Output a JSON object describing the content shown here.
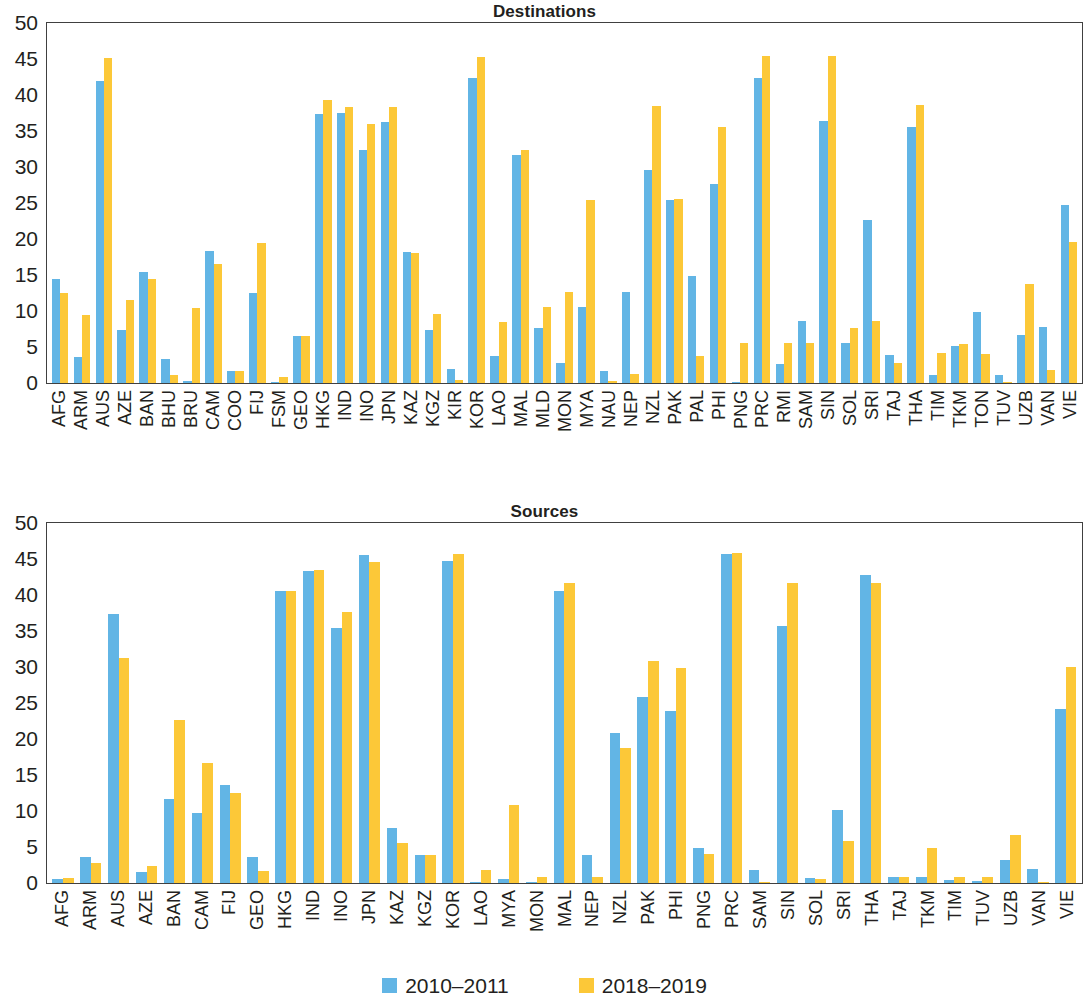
{
  "figure": {
    "legend": {
      "position": "bottom-center",
      "entries": [
        {
          "label": "2010–2011",
          "color": "#62b5e5",
          "icon": "legend-swatch"
        },
        {
          "label": "2018–2019",
          "color": "#fcc838",
          "icon": "legend-swatch"
        }
      ]
    }
  },
  "chart_data": [
    {
      "type": "bar",
      "title": "Destinations",
      "xlabel": "",
      "ylabel": "",
      "ylim": [
        0,
        50
      ],
      "yticks": [
        0,
        5,
        10,
        15,
        20,
        25,
        30,
        35,
        40,
        45,
        50
      ],
      "grid": false,
      "legend_position": "bottom-center",
      "categories": [
        "AFG",
        "ARM",
        "AUS",
        "AZE",
        "BAN",
        "BHU",
        "BRU",
        "CAM",
        "COO",
        "FIJ",
        "FSM",
        "GEO",
        "HKG",
        "IND",
        "INO",
        "JPN",
        "KAZ",
        "KGZ",
        "KIR",
        "KOR",
        "LAO",
        "MAL",
        "MLD",
        "MON",
        "MYA",
        "NAU",
        "NEP",
        "NZL",
        "PAK",
        "PAL",
        "PHI",
        "PNG",
        "PRC",
        "RMI",
        "SAM",
        "SIN",
        "SOL",
        "SRI",
        "TAJ",
        "THA",
        "TIM",
        "TKM",
        "TON",
        "TUV",
        "UZB",
        "VAN",
        "VIE"
      ],
      "series": [
        {
          "name": "2010–2011",
          "color": "#62b5e5",
          "values": [
            14.4,
            3.6,
            42.0,
            7.3,
            15.4,
            3.4,
            0.3,
            18.4,
            1.7,
            12.5,
            0.1,
            6.5,
            37.4,
            37.5,
            32.4,
            36.2,
            18.2,
            7.4,
            2.0,
            42.3,
            3.8,
            31.6,
            7.6,
            2.8,
            10.6,
            1.7,
            12.6,
            29.6,
            25.4,
            14.8,
            27.6,
            0.1,
            42.4,
            2.6,
            8.6,
            36.4,
            5.6,
            22.6,
            3.9,
            35.6,
            1.1,
            5.2,
            9.8,
            1.1,
            6.7,
            7.8,
            24.7
          ]
        },
        {
          "name": "2018–2019",
          "color": "#fcc838",
          "values": [
            12.5,
            9.5,
            45.1,
            11.5,
            14.5,
            1.1,
            10.4,
            16.5,
            1.6,
            19.4,
            0.9,
            6.5,
            39.3,
            38.3,
            36.0,
            38.3,
            18.0,
            9.6,
            0.4,
            45.3,
            8.5,
            32.3,
            10.6,
            12.7,
            25.4,
            0.3,
            1.2,
            38.5,
            25.5,
            3.8,
            35.5,
            5.6,
            45.4,
            5.5,
            5.6,
            45.4,
            7.6,
            8.6,
            2.8,
            38.6,
            4.1,
            5.4,
            4.0,
            0.2,
            13.8,
            1.8,
            19.6
          ]
        }
      ]
    },
    {
      "type": "bar",
      "title": "Sources",
      "xlabel": "",
      "ylabel": "",
      "ylim": [
        0,
        50
      ],
      "yticks": [
        0,
        5,
        10,
        15,
        20,
        25,
        30,
        35,
        40,
        45,
        50
      ],
      "grid": false,
      "legend_position": "bottom-center",
      "categories": [
        "AFG",
        "ARM",
        "AUS",
        "AZE",
        "BAN",
        "CAM",
        "FIJ",
        "GEO",
        "HKG",
        "IND",
        "INO",
        "JPN",
        "KAZ",
        "KGZ",
        "KOR",
        "LAO",
        "MYA",
        "MON",
        "MAL",
        "NEP",
        "NZL",
        "PAK",
        "PHI",
        "PNG",
        "PRC",
        "SAM",
        "SIN",
        "SOL",
        "SRI",
        "THA",
        "TAJ",
        "TKM",
        "TIM",
        "TUV",
        "UZB",
        "VAN",
        "VIE"
      ],
      "series": [
        {
          "name": "2010–2011",
          "color": "#62b5e5",
          "values": [
            0.6,
            3.6,
            37.3,
            1.5,
            11.6,
            9.7,
            13.6,
            3.6,
            40.5,
            43.4,
            35.4,
            45.6,
            7.6,
            3.9,
            44.7,
            0.2,
            0.5,
            0.1,
            40.6,
            3.9,
            20.8,
            25.8,
            23.9,
            4.8,
            45.7,
            1.8,
            35.7,
            0.7,
            10.1,
            42.8,
            0.9,
            0.8,
            0.4,
            0.3,
            3.2,
            1.9,
            24.1
          ]
        },
        {
          "name": "2018–2019",
          "color": "#fcc838",
          "values": [
            0.7,
            2.8,
            31.3,
            2.4,
            22.6,
            16.6,
            12.5,
            1.6,
            40.6,
            43.5,
            37.6,
            44.6,
            5.6,
            3.9,
            45.7,
            1.8,
            10.9,
            0.8,
            41.6,
            0.9,
            18.8,
            30.8,
            29.8,
            4.0,
            45.9,
            0.1,
            41.6,
            0.6,
            5.9,
            41.7,
            0.9,
            4.9,
            0.8,
            0.8,
            6.7,
            0.2,
            30.0
          ]
        }
      ]
    }
  ]
}
